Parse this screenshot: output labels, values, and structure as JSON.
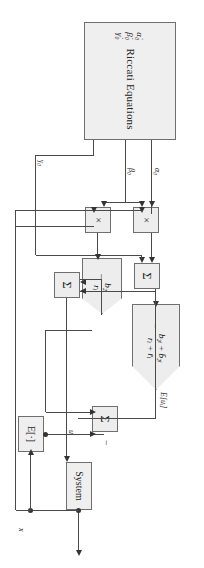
{
  "diagram": {
    "orientation": "rotated-90"
  },
  "blocks": {
    "riccati": {
      "title": "Riccati Equations",
      "states": [
        "α̇₀",
        "β̇₀",
        "γ̇₀"
      ]
    },
    "mult1": {
      "symbol": "×"
    },
    "mult2": {
      "symbol": "×"
    },
    "sum1": {
      "symbol": "Σ"
    },
    "sum2": {
      "symbol": "Σ"
    },
    "sum3": {
      "symbol": "Σ"
    },
    "gain_small": {
      "num": "b₂ᵢ",
      "den": "rᵢ",
      "sign": "−"
    },
    "gain_big": {
      "num": "b₂ᵢ + b̄₂ᵢ",
      "den": "rᵢ + r̄ᵢ",
      "sign": "−"
    },
    "system": {
      "label": "System"
    },
    "expectation": {
      "label": "E[·]"
    }
  },
  "signals": {
    "alpha0": "α₀",
    "beta0": "β₀",
    "gamma0": "γ₀",
    "u_i": "uᵢ",
    "x": "x",
    "E_u_i": "E[uᵢ]",
    "minus": "−"
  },
  "colors": {
    "block_fill": "#efefef",
    "block_border": "#6f6f6f",
    "wire": "#4a4a4a",
    "page": "#ffffff"
  }
}
